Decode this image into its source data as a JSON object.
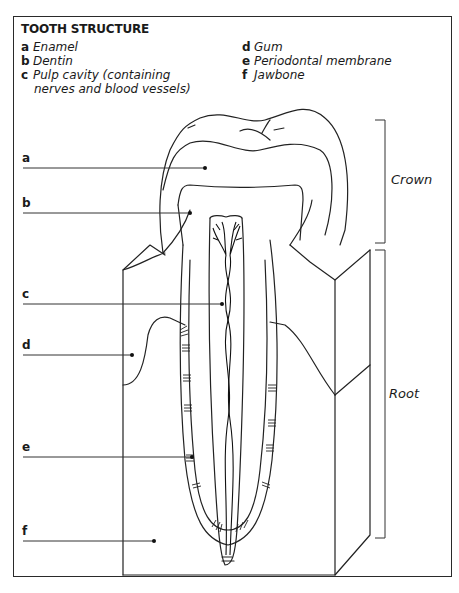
{
  "title": "TOOTH STRUCTURE",
  "legend": {
    "left": [
      {
        "key": "a",
        "text": "Enamel"
      },
      {
        "key": "b",
        "text": "Dentin"
      },
      {
        "key": "c",
        "text": "Pulp cavity (containing",
        "continuation": "nerves and blood vessels)"
      }
    ],
    "right": [
      {
        "key": "d",
        "text": "Gum"
      },
      {
        "key": "e",
        "text": "Periodontal membrane"
      },
      {
        "key": "f",
        "text": "Jawbone"
      }
    ]
  },
  "labels": {
    "a": "a",
    "b": "b",
    "c": "c",
    "d": "d",
    "e": "e",
    "f": "f"
  },
  "regions": {
    "crown": "Crown",
    "root": "Root"
  }
}
